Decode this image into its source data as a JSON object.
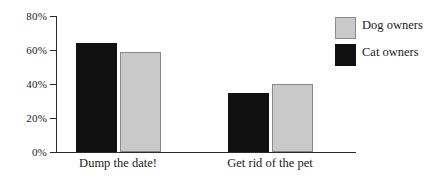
{
  "chart_data": {
    "type": "bar",
    "title": "",
    "subtitle": "",
    "xlabel": "",
    "ylabel": "",
    "categories": [
      "Dump the date!",
      "Get rid of the pet"
    ],
    "series": [
      {
        "name": "Cat owners",
        "color": "#111111",
        "values": [
          64,
          35
        ]
      },
      {
        "name": "Dog owners",
        "color": "#c9c9c9",
        "values": [
          59,
          40
        ]
      }
    ],
    "series_draw_order": [
      "Cat owners",
      "Dog owners"
    ],
    "ylim": [
      0,
      80
    ],
    "yticks": [
      0,
      20,
      40,
      60,
      80
    ],
    "ytick_labels": [
      "0%",
      "20%",
      "40%",
      "60%",
      "80%"
    ],
    "value_suffix": "%",
    "grid": false,
    "legend_position": "right-top",
    "legend_order": [
      "Dog owners",
      "Cat owners"
    ]
  },
  "axis": {
    "ticks": [
      {
        "label": "80%",
        "value": 80
      },
      {
        "label": "60%",
        "value": 60
      },
      {
        "label": "40%",
        "value": 40
      },
      {
        "label": "20%",
        "value": 20
      },
      {
        "label": "0%",
        "value": 0
      }
    ]
  },
  "legend": {
    "items": [
      {
        "label": "Dog owners",
        "swatch": "dog"
      },
      {
        "label": "Cat owners",
        "swatch": "cat"
      }
    ]
  },
  "categories": [
    {
      "label": "Dump the date!"
    },
    {
      "label": "Get rid of the pet"
    }
  ]
}
